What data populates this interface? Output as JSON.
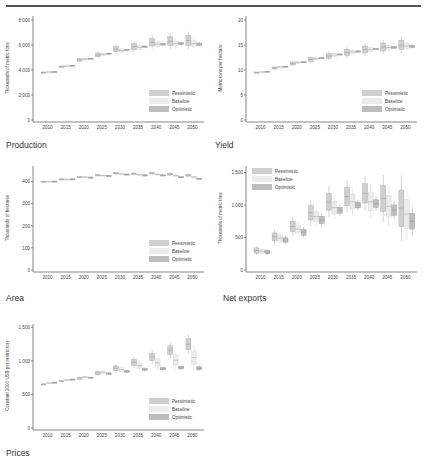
{
  "page": {
    "top_rule": true
  },
  "legend": {
    "entries": [
      {
        "name": "Pessimistic",
        "color": "#cfcfcf"
      },
      {
        "name": "Baseline",
        "color": "#ececec"
      },
      {
        "name": "Optimistic",
        "color": "#bdbdbd"
      }
    ]
  },
  "chart_data": [
    {
      "id": "production",
      "type": "boxplot",
      "title": "Production",
      "ylabel": "Thousands of metric tons",
      "xlabel": "",
      "categories": [
        "2010",
        "2015",
        "2020",
        "2025",
        "2030",
        "2035",
        "2040",
        "2045",
        "2050"
      ],
      "yticks": [
        0,
        2000,
        4000,
        6000,
        8000
      ],
      "ytick_labels": [
        "0",
        "2,000",
        "4,000",
        "6,000",
        "8,000"
      ],
      "ylim": [
        0,
        8300
      ],
      "legend_position": "bottom-right",
      "series": [
        {
          "name": "Pessimistic",
          "values": [
            3800,
            4250,
            4800,
            5200,
            5650,
            5850,
            6200,
            6300,
            6350
          ],
          "spread": [
            30,
            60,
            100,
            150,
            200,
            250,
            300,
            350,
            400
          ]
        },
        {
          "name": "Baseline",
          "values": [
            3830,
            4300,
            4850,
            5250,
            5550,
            5800,
            6050,
            6100,
            6100
          ],
          "spread": [
            20,
            40,
            60,
            80,
            120,
            150,
            180,
            200,
            220
          ]
        },
        {
          "name": "Optimistic",
          "values": [
            3850,
            4350,
            4900,
            5300,
            5600,
            5850,
            6050,
            6100,
            6050
          ],
          "spread": [
            10,
            20,
            30,
            40,
            50,
            60,
            70,
            80,
            90
          ]
        }
      ]
    },
    {
      "id": "yield",
      "type": "boxplot",
      "title": "Yield",
      "ylabel": "Metric tons per hectare",
      "xlabel": "",
      "categories": [
        "2010",
        "2015",
        "2020",
        "2025",
        "2030",
        "2035",
        "2040",
        "2045",
        "2050"
      ],
      "yticks": [
        0,
        5,
        10,
        15,
        20
      ],
      "ytick_labels": [
        "0",
        "5",
        "10",
        "15",
        "20"
      ],
      "ylim": [
        0,
        20.8
      ],
      "legend_position": "bottom-right",
      "series": [
        {
          "name": "Pessimistic",
          "values": [
            9.5,
            10.4,
            11.3,
            12.1,
            12.8,
            13.5,
            14.1,
            14.6,
            15.0
          ],
          "spread": [
            0.1,
            0.2,
            0.3,
            0.4,
            0.5,
            0.6,
            0.7,
            0.8,
            0.9
          ]
        },
        {
          "name": "Baseline",
          "values": [
            9.6,
            10.6,
            11.5,
            12.3,
            13.0,
            13.6,
            14.1,
            14.5,
            14.8
          ],
          "spread": [
            0.05,
            0.1,
            0.15,
            0.2,
            0.25,
            0.3,
            0.35,
            0.4,
            0.45
          ]
        },
        {
          "name": "Optimistic",
          "values": [
            9.7,
            10.7,
            11.6,
            12.4,
            13.1,
            13.7,
            14.2,
            14.5,
            14.7
          ],
          "spread": [
            0.03,
            0.05,
            0.07,
            0.1,
            0.12,
            0.14,
            0.16,
            0.18,
            0.2
          ]
        }
      ]
    },
    {
      "id": "area",
      "type": "boxplot",
      "title": "Area",
      "ylabel": "Thousands of hectares",
      "xlabel": "",
      "categories": [
        "2010",
        "2015",
        "2020",
        "2025",
        "2030",
        "2035",
        "2040",
        "2045",
        "2050"
      ],
      "yticks": [
        0,
        100,
        200,
        300,
        400
      ],
      "ytick_labels": [
        "0",
        "100",
        "200",
        "300",
        "400"
      ],
      "ylim": [
        0,
        470
      ],
      "legend_position": "bottom-right",
      "series": [
        {
          "name": "Pessimistic",
          "values": [
            400,
            410,
            420,
            428,
            437,
            435,
            437,
            433,
            428
          ],
          "spread": [
            1,
            2,
            2,
            3,
            3,
            3,
            3,
            4,
            4
          ]
        },
        {
          "name": "Baseline",
          "values": [
            400,
            410,
            420,
            427,
            434,
            431,
            432,
            427,
            420
          ],
          "spread": [
            1,
            1,
            2,
            2,
            2,
            2,
            2,
            3,
            3
          ]
        },
        {
          "name": "Optimistic",
          "values": [
            401,
            411,
            419,
            426,
            432,
            428,
            428,
            420,
            412
          ],
          "spread": [
            1,
            1,
            1,
            1,
            2,
            2,
            2,
            2,
            2
          ]
        }
      ]
    },
    {
      "id": "net_exports",
      "type": "boxplot",
      "title": "Net exports",
      "ylabel": "Thousands of metric tons",
      "xlabel": "",
      "categories": [
        "2010",
        "2015",
        "2020",
        "2025",
        "2030",
        "2035",
        "2040",
        "2045",
        "2050"
      ],
      "yticks": [
        0,
        500,
        1000,
        1500
      ],
      "ytick_labels": [
        "0",
        "500",
        "1,000",
        "1,500"
      ],
      "ylim": [
        0,
        1600
      ],
      "legend_position": "top-left",
      "series": [
        {
          "name": "Pessimistic",
          "values": [
            300,
            510,
            670,
            880,
            1050,
            1130,
            1180,
            1100,
            950
          ],
          "spread": [
            40,
            60,
            80,
            110,
            130,
            140,
            150,
            200,
            280
          ]
        },
        {
          "name": "Baseline",
          "values": [
            290,
            490,
            630,
            820,
            960,
            1050,
            1050,
            980,
            860
          ],
          "spread": [
            30,
            50,
            60,
            80,
            100,
            120,
            140,
            170,
            220
          ]
        },
        {
          "name": "Optimistic",
          "values": [
            275,
            460,
            580,
            770,
            920,
            1000,
            1020,
            920,
            750
          ],
          "spread": [
            25,
            35,
            45,
            55,
            45,
            45,
            60,
            80,
            120
          ]
        }
      ]
    },
    {
      "id": "prices",
      "type": "boxplot",
      "title": "Prices",
      "ylabel": "Constant 2000 US$ per metric ton",
      "xlabel": "",
      "categories": [
        "2010",
        "2015",
        "2020",
        "2025",
        "2030",
        "2035",
        "2040",
        "2045",
        "2050"
      ],
      "yticks": [
        0,
        500,
        1000,
        1500
      ],
      "ytick_labels": [
        "0",
        "500",
        "1,000",
        "1,500"
      ],
      "ylim": [
        0,
        1550
      ],
      "legend_position": "bottom-right",
      "series": [
        {
          "name": "Pessimistic",
          "values": [
            650,
            700,
            740,
            820,
            890,
            980,
            1060,
            1160,
            1250
          ],
          "spread": [
            8,
            10,
            15,
            25,
            35,
            45,
            55,
            65,
            80
          ]
        },
        {
          "name": "Baseline",
          "values": [
            670,
            715,
            760,
            830,
            870,
            930,
            970,
            1010,
            1050
          ],
          "spread": [
            5,
            8,
            12,
            20,
            30,
            40,
            60,
            80,
            100
          ]
        },
        {
          "name": "Optimistic",
          "values": [
            680,
            725,
            750,
            810,
            845,
            875,
            885,
            900,
            890
          ],
          "spread": [
            4,
            5,
            8,
            12,
            14,
            16,
            18,
            20,
            22
          ]
        }
      ]
    }
  ]
}
